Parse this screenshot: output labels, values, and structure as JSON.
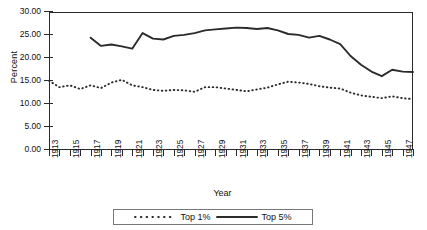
{
  "chart_data": {
    "type": "line",
    "title": "",
    "xlabel": "Year",
    "ylabel": "Percent",
    "ylim": [
      0,
      30
    ],
    "ytick_values": [
      0,
      5,
      10,
      15,
      20,
      25,
      30
    ],
    "ytick_labels": [
      "0.00",
      "5.00",
      "10.00",
      "15.00",
      "20.00",
      "25.00",
      "30.00"
    ],
    "xlim": [
      1913,
      1948
    ],
    "xtick_years": [
      1913,
      1914,
      1915,
      1916,
      1917,
      1918,
      1919,
      1920,
      1921,
      1922,
      1923,
      1924,
      1925,
      1926,
      1927,
      1928,
      1929,
      1930,
      1931,
      1932,
      1933,
      1934,
      1935,
      1936,
      1937,
      1938,
      1939,
      1940,
      1941,
      1942,
      1943,
      1944,
      1945,
      1946,
      1947,
      1948
    ],
    "xtick_labels": [
      "1913",
      "1915",
      "1917",
      "1919",
      "1921",
      "1923",
      "1925",
      "1927",
      "1929",
      "1931",
      "1933",
      "1935",
      "1937",
      "1939",
      "1941",
      "1943",
      "1945",
      "1947"
    ],
    "xtick_label_years": [
      1913,
      1915,
      1917,
      1919,
      1921,
      1923,
      1925,
      1927,
      1929,
      1931,
      1933,
      1935,
      1937,
      1939,
      1941,
      1943,
      1945,
      1947
    ],
    "grid": false,
    "legend_position": "bottom-center",
    "line_color": "#2b2b2b",
    "series": [
      {
        "name": "Top 1%",
        "style": "dotted",
        "x": [
          1913,
          1914,
          1915,
          1916,
          1917,
          1918,
          1919,
          1920,
          1921,
          1922,
          1923,
          1924,
          1925,
          1926,
          1927,
          1928,
          1929,
          1930,
          1931,
          1932,
          1933,
          1934,
          1935,
          1936,
          1937,
          1938,
          1939,
          1940,
          1941,
          1942,
          1943,
          1944,
          1945,
          1946,
          1947,
          1948
        ],
        "values": [
          15.0,
          13.6,
          14.0,
          13.2,
          14.0,
          13.4,
          14.6,
          15.2,
          14.0,
          13.6,
          13.0,
          12.8,
          13.0,
          12.9,
          12.6,
          13.6,
          13.6,
          13.3,
          13.0,
          12.7,
          13.1,
          13.5,
          14.2,
          14.8,
          14.6,
          14.3,
          13.8,
          13.5,
          13.3,
          12.4,
          11.8,
          11.5,
          11.2,
          11.6,
          11.2,
          11.0
        ]
      },
      {
        "name": "Top 5%",
        "style": "solid",
        "x": [
          1917,
          1918,
          1919,
          1920,
          1921,
          1922,
          1923,
          1924,
          1925,
          1926,
          1927,
          1928,
          1929,
          1930,
          1931,
          1932,
          1933,
          1934,
          1935,
          1936,
          1937,
          1938,
          1939,
          1940,
          1941,
          1942,
          1943,
          1944,
          1945,
          1946,
          1947,
          1948
        ],
        "values": [
          24.4,
          22.6,
          22.9,
          22.5,
          22.0,
          25.4,
          24.2,
          24.0,
          24.8,
          25.0,
          25.4,
          26.0,
          26.2,
          26.4,
          26.6,
          26.5,
          26.3,
          26.5,
          26.0,
          25.2,
          25.0,
          24.4,
          24.8,
          24.0,
          23.0,
          20.4,
          18.5,
          17.0,
          16.0,
          17.4,
          17.0,
          16.9
        ]
      }
    ]
  },
  "legend": {
    "items": [
      {
        "label": "Top 1%",
        "style": "dotted"
      },
      {
        "label": "Top 5%",
        "style": "solid"
      }
    ]
  }
}
